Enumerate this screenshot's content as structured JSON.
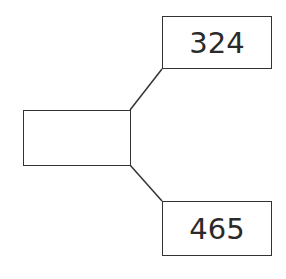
{
  "diagram": {
    "type": "part-whole number bond",
    "whole": {
      "value": ""
    },
    "parts": [
      {
        "value": "324"
      },
      {
        "value": "465"
      }
    ],
    "colors": {
      "stroke": "#333333",
      "text": "#2a2a2a",
      "background": "#ffffff"
    }
  }
}
